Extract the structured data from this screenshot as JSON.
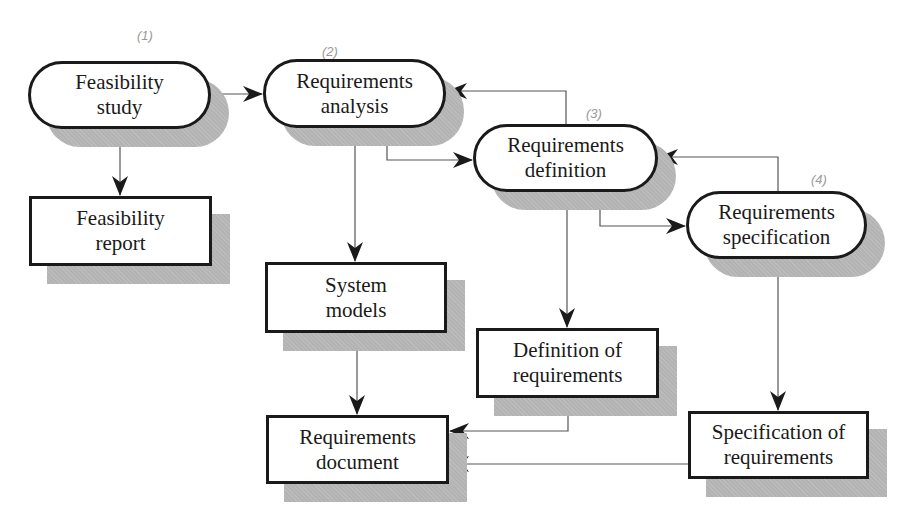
{
  "diagram": {
    "type": "flowchart",
    "title": "",
    "processes": [
      {
        "id": "feasibility-study",
        "label": "Feasibility\nstudy",
        "annotation": "(1)"
      },
      {
        "id": "requirements-analysis",
        "label": "Requirements\nanalysis",
        "annotation": "(2)"
      },
      {
        "id": "requirements-definition",
        "label": "Requirements\ndefinition",
        "annotation": "(3)"
      },
      {
        "id": "requirements-specification",
        "label": "Requirements\nspecification",
        "annotation": "(4)"
      }
    ],
    "documents": [
      {
        "id": "feasibility-report",
        "label": "Feasibility\nreport"
      },
      {
        "id": "system-models",
        "label": "System\nmodels"
      },
      {
        "id": "definition-of-requirements",
        "label": "Definition of\nrequirements"
      },
      {
        "id": "requirements-document",
        "label": "Requirements\ndocument"
      },
      {
        "id": "specification-of-requirements",
        "label": "Specification of\nrequirements"
      }
    ],
    "edges": [
      {
        "from": "feasibility-study",
        "to": "requirements-analysis"
      },
      {
        "from": "feasibility-study",
        "to": "feasibility-report"
      },
      {
        "from": "requirements-analysis",
        "to": "requirements-definition"
      },
      {
        "from": "requirements-analysis",
        "to": "system-models"
      },
      {
        "from": "requirements-definition",
        "to": "requirements-analysis"
      },
      {
        "from": "requirements-definition",
        "to": "requirements-specification"
      },
      {
        "from": "requirements-definition",
        "to": "definition-of-requirements"
      },
      {
        "from": "requirements-specification",
        "to": "requirements-definition"
      },
      {
        "from": "requirements-specification",
        "to": "specification-of-requirements"
      },
      {
        "from": "system-models",
        "to": "requirements-document"
      },
      {
        "from": "definition-of-requirements",
        "to": "requirements-document"
      },
      {
        "from": "specification-of-requirements",
        "to": "requirements-document"
      }
    ]
  },
  "colors": {
    "stroke": "#1a1a1a",
    "shadow": "#b3b3b3",
    "annotation": "#9a9a9a"
  }
}
